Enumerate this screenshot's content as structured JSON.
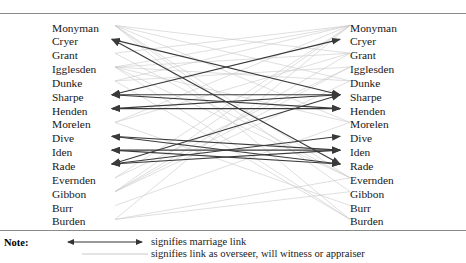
{
  "figure": {
    "type": "network-diagram",
    "left_column_label": "left-names",
    "right_column_label": "right-names",
    "names": [
      "Monyman",
      "Cryer",
      "Grant",
      "Igglesden",
      "Dunke",
      "Sharpe",
      "Henden",
      "Morelen",
      "Dive",
      "Iden",
      "Rade",
      "Evernden",
      "Gibbon",
      "Burr",
      "Burden"
    ]
  },
  "note": {
    "label": "Note:",
    "legend": [
      {
        "sample": "double-headed-arrow",
        "text": "signifies marriage link",
        "color": "#333333"
      },
      {
        "sample": "faint-line",
        "text": "signifies link as overseer, will witness or appraiser",
        "color": "#bbbbbb"
      }
    ]
  },
  "chart_data": {
    "type": "network",
    "title": "",
    "layout": "bipartite-mirrored-columns",
    "nodes_left": [
      "Monyman",
      "Cryer",
      "Grant",
      "Igglesden",
      "Dunke",
      "Sharpe",
      "Henden",
      "Morelen",
      "Dive",
      "Iden",
      "Rade",
      "Evernden",
      "Gibbon",
      "Burr",
      "Burden"
    ],
    "nodes_right": [
      "Monyman",
      "Cryer",
      "Grant",
      "Igglesden",
      "Dunke",
      "Sharpe",
      "Henden",
      "Morelen",
      "Dive",
      "Iden",
      "Rade",
      "Evernden",
      "Gibbon",
      "Burr",
      "Burden"
    ],
    "edge_types": {
      "marriage": {
        "color": "#3a3a3a",
        "width": 1.15,
        "arrowheads": "both-ends"
      },
      "overseer": {
        "color": "#c9c9c9",
        "width": 0.6,
        "arrowheads": "none"
      }
    },
    "marriage_links": [
      {
        "from": "Cryer",
        "to": "Sharpe"
      },
      {
        "from": "Sharpe",
        "to": "Cryer"
      },
      {
        "from": "Sharpe",
        "to": "Sharpe"
      },
      {
        "from": "Henden",
        "to": "Sharpe"
      },
      {
        "from": "Henden",
        "to": "Henden"
      },
      {
        "from": "Sharpe",
        "to": "Henden"
      },
      {
        "from": "Dive",
        "to": "Rade"
      },
      {
        "from": "Iden",
        "to": "Iden"
      },
      {
        "from": "Iden",
        "to": "Rade"
      },
      {
        "from": "Rade",
        "to": "Dive"
      },
      {
        "from": "Rade",
        "to": "Iden"
      },
      {
        "from": "Dive",
        "to": "Iden"
      },
      {
        "from": "Cryer",
        "to": "Rade"
      },
      {
        "from": "Rade",
        "to": "Sharpe"
      }
    ],
    "overseer_links": [
      {
        "from": "Monyman",
        "to": "Grant"
      },
      {
        "from": "Monyman",
        "to": "Dunke"
      },
      {
        "from": "Monyman",
        "to": "Morelen"
      },
      {
        "from": "Monyman",
        "to": "Evernden"
      },
      {
        "from": "Monyman",
        "to": "Burden"
      },
      {
        "from": "Grant",
        "to": "Monyman"
      },
      {
        "from": "Igglesden",
        "to": "Monyman"
      },
      {
        "from": "Igglesden",
        "to": "Grant"
      },
      {
        "from": "Igglesden",
        "to": "Dunke"
      },
      {
        "from": "Igglesden",
        "to": "Morelen"
      },
      {
        "from": "Igglesden",
        "to": "Evernden"
      },
      {
        "from": "Dunke",
        "to": "Monyman"
      },
      {
        "from": "Dunke",
        "to": "Igglesden"
      },
      {
        "from": "Morelen",
        "to": "Monyman"
      },
      {
        "from": "Morelen",
        "to": "Grant"
      },
      {
        "from": "Evernden",
        "to": "Monyman"
      },
      {
        "from": "Evernden",
        "to": "Igglesden"
      },
      {
        "from": "Gibbon",
        "to": "Monyman"
      },
      {
        "from": "Gibbon",
        "to": "Grant"
      },
      {
        "from": "Gibbon",
        "to": "Dunke"
      },
      {
        "from": "Gibbon",
        "to": "Igglesden"
      },
      {
        "from": "Burr",
        "to": "Morelen"
      },
      {
        "from": "Burden",
        "to": "Monyman"
      },
      {
        "from": "Burden",
        "to": "Evernden"
      },
      {
        "from": "Burden",
        "to": "Gibbon"
      },
      {
        "from": "Monyman",
        "to": "Gibbon"
      },
      {
        "from": "Grant",
        "to": "Evernden"
      },
      {
        "from": "Dunke",
        "to": "Burden"
      },
      {
        "from": "Morelen",
        "to": "Burr"
      },
      {
        "from": "Igglesden",
        "to": "Burden"
      }
    ]
  },
  "colors": {
    "rule": "#8a8a8a",
    "text": "#171717",
    "marriage_line": "#3a3a3a",
    "overseer_line": "#c9c9c9",
    "background": "#ffffff"
  }
}
